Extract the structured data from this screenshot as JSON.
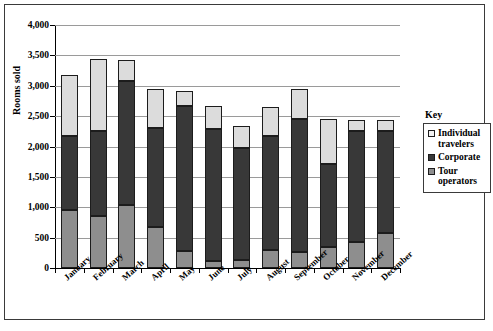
{
  "chart_data": {
    "type": "bar",
    "subtype": "stacked-column",
    "title": "",
    "xlabel": "",
    "ylabel": "Rooms sold",
    "ylim": [
      0,
      4000
    ],
    "ytick_step": 500,
    "ytick_labels": [
      "4,000",
      "3,500",
      "3,000",
      "2,500",
      "2,000",
      "1,500",
      "1,000",
      "500",
      "0"
    ],
    "ytick_values": [
      4000,
      3500,
      3000,
      2500,
      2000,
      1500,
      1000,
      500,
      0
    ],
    "grid": "horizontal",
    "legend_position": "right",
    "legend_title": "Key",
    "categories": [
      "January",
      "February",
      "March",
      "April",
      "May",
      "June",
      "July",
      "August",
      "September",
      "October",
      "November",
      "December"
    ],
    "series": [
      {
        "name": "Tour operators",
        "color": "#8e8e8e",
        "values": [
          960,
          850,
          1030,
          670,
          280,
          120,
          130,
          290,
          270,
          340,
          430,
          580
        ]
      },
      {
        "name": "Corporate",
        "color": "#383838",
        "values": [
          1210,
          1410,
          2040,
          1630,
          2390,
          2160,
          1850,
          1890,
          2180,
          1370,
          1820,
          1670
        ]
      },
      {
        "name": "Individual travelers",
        "color": "#dcdcdc",
        "values": [
          1000,
          1180,
          350,
          650,
          240,
          380,
          360,
          470,
          500,
          740,
          190,
          190
        ]
      }
    ],
    "stack_tops": {
      "tour_operators": [
        960,
        850,
        1030,
        670,
        280,
        120,
        130,
        290,
        270,
        340,
        430,
        580
      ],
      "corporate": [
        2170,
        2260,
        3070,
        2300,
        2670,
        2280,
        1980,
        2180,
        2450,
        1710,
        2250,
        2250
      ],
      "total": [
        3170,
        3440,
        3420,
        2950,
        2910,
        2660,
        2340,
        2650,
        2950,
        2450,
        2440,
        2440
      ]
    }
  },
  "legend": {
    "title": "Key",
    "items": [
      {
        "label": "Individual travelers",
        "key": "individual-travelers"
      },
      {
        "label": "Corporate",
        "key": "corporate"
      },
      {
        "label": "Tour operators",
        "key": "tour-operators"
      }
    ]
  },
  "axes": {
    "y_title": "Rooms sold"
  }
}
